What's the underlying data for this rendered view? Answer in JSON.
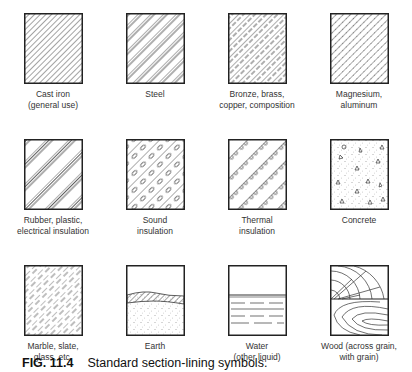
{
  "figure": {
    "number": "FIG. 11.4",
    "caption": "Standard section-lining symbols."
  },
  "symbols": [
    {
      "label": "Cast iron\n(general use)",
      "pattern": "cast-iron"
    },
    {
      "label": "Steel",
      "pattern": "steel"
    },
    {
      "label": "Bronze, brass,\ncopper, composition",
      "pattern": "bronze"
    },
    {
      "label": "Magnesium,\naluminum",
      "pattern": "magnesium"
    },
    {
      "label": "Rubber, plastic,\nelectrical insulation",
      "pattern": "rubber"
    },
    {
      "label": "Sound\ninsulation",
      "pattern": "sound-insulation"
    },
    {
      "label": "Thermal\ninsulation",
      "pattern": "thermal-insulation"
    },
    {
      "label": "Concrete",
      "pattern": "concrete"
    },
    {
      "label": "Marble, slate,\nglass, etc.",
      "pattern": "marble"
    },
    {
      "label": "Earth",
      "pattern": "earth"
    },
    {
      "label": "Water\n(other liquid)",
      "pattern": "water"
    },
    {
      "label": "Wood (across grain,\nwith grain)",
      "pattern": "wood"
    }
  ]
}
